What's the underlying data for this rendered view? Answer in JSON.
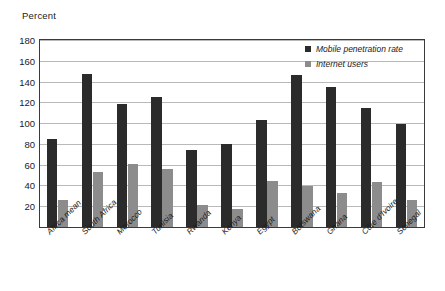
{
  "chart_data": {
    "type": "bar",
    "title": "",
    "subtitle": "",
    "xlabel": "",
    "ylabel": "Percent",
    "ylim": [
      0,
      180
    ],
    "ytick_step": 20,
    "yticks": [
      20,
      40,
      60,
      80,
      100,
      120,
      140,
      160,
      180
    ],
    "grid": "horizontal",
    "legend_position": "top-right",
    "categories": [
      "Africa mean",
      "South Africa",
      "Morocco",
      "Tunisia",
      "Rwanda",
      "Kenya",
      "Egypt",
      "Botswana",
      "Ghana",
      "Côte d'Ivoire",
      "Senegal"
    ],
    "series": [
      {
        "name": "Mobile penetration rate",
        "color": "#2b2b2b",
        "values": [
          85,
          147,
          118,
          125,
          74,
          80,
          103,
          146,
          135,
          115,
          99
        ]
      },
      {
        "name": "Internet users",
        "color": "#8c8c8c",
        "values": [
          26,
          53,
          61,
          56,
          21,
          17,
          44,
          39,
          33,
          43,
          26
        ]
      }
    ]
  },
  "axis": {
    "y_title": "Percent"
  },
  "colors": {
    "series_dark": "#2b2b2b",
    "series_gray": "#8c8c8c",
    "gridline": "#b9b9b9",
    "frame": "#3a3a3a",
    "text": "#1a1a1a",
    "background": "#ffffff"
  }
}
